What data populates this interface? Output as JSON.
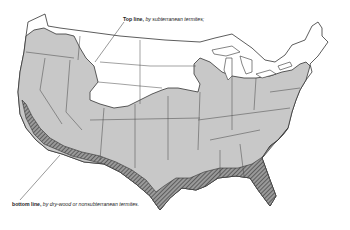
{
  "map": {
    "subject": "Termite infestation zones, United States",
    "regions": [
      {
        "name": "northern-uninfested",
        "fill": "#ffffff",
        "description": "Northern states above top line"
      },
      {
        "name": "subterranean-zone",
        "fill": "#c8c8c8",
        "description": "Area below top line — subterranean termites"
      },
      {
        "name": "drywood-zone",
        "fill": "hatched",
        "description": "Southern coastal band below bottom line — dry-wood or nonsubterranean termites"
      }
    ],
    "colors": {
      "background": "#ffffff",
      "shaded": "#c8c8c8",
      "outline": "#333333",
      "hatch": "#555555"
    }
  },
  "labels": {
    "top": {
      "bold": "Top line,",
      "italic": " by subterranean termites;"
    },
    "bottom": {
      "bold": "bottom line,",
      "italic": " by dry-wood or nonsubterranean termites."
    }
  }
}
